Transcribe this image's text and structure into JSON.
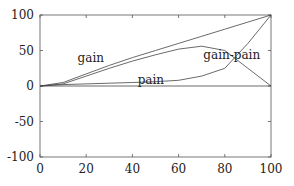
{
  "chart_data": {
    "type": "line",
    "title": "",
    "xlabel": "",
    "ylabel": "",
    "xlim": [
      0,
      100
    ],
    "ylim": [
      -100,
      100
    ],
    "xticks": [
      0,
      20,
      40,
      60,
      80,
      100
    ],
    "yticks": [
      -100,
      -50,
      0,
      50,
      100
    ],
    "xtick_labels": [
      "0",
      "20",
      "40",
      "60",
      "80",
      "100"
    ],
    "ytick_labels": [
      "-100",
      "-50",
      "0",
      "50",
      "100"
    ],
    "grid": false,
    "legend": "none",
    "annotations": [
      {
        "text": "gain",
        "x": 22,
        "y": 40
      },
      {
        "text": "pain",
        "x": 48,
        "y": 8
      },
      {
        "text": "gain-pain",
        "x": 83,
        "y": 44
      }
    ],
    "series": [
      {
        "name": "gain",
        "x": [
          0,
          10,
          20,
          30,
          40,
          50,
          60,
          70,
          80,
          90,
          100
        ],
        "values": [
          0,
          5,
          17,
          29,
          40,
          50,
          60,
          70,
          80,
          90,
          100
        ]
      },
      {
        "name": "gain-pain",
        "x": [
          0,
          10,
          20,
          30,
          40,
          50,
          60,
          70,
          80,
          90,
          100
        ],
        "values": [
          0,
          3,
          14,
          25,
          35,
          44,
          52,
          56,
          50,
          25,
          0
        ]
      },
      {
        "name": "pain",
        "x": [
          0,
          10,
          20,
          30,
          40,
          50,
          60,
          70,
          80,
          90,
          100
        ],
        "values": [
          0,
          2,
          3,
          4,
          5,
          6,
          8,
          14,
          25,
          60,
          100
        ]
      },
      {
        "name": "zero",
        "x": [
          0,
          100
        ],
        "values": [
          0,
          0
        ]
      }
    ]
  }
}
